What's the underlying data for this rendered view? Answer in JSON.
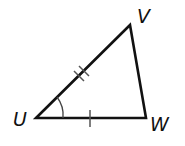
{
  "diagram": {
    "type": "triangle",
    "vertices": {
      "U": {
        "label": "U",
        "x": 36,
        "y": 118
      },
      "V": {
        "label": "V",
        "x": 130,
        "y": 25
      },
      "W": {
        "label": "W",
        "x": 146,
        "y": 118
      }
    },
    "markings": {
      "UV": {
        "ticks": 2
      },
      "UW": {
        "ticks": 1
      },
      "angle_U": {
        "arcs": 1
      }
    },
    "stroke_color": "#111111"
  }
}
